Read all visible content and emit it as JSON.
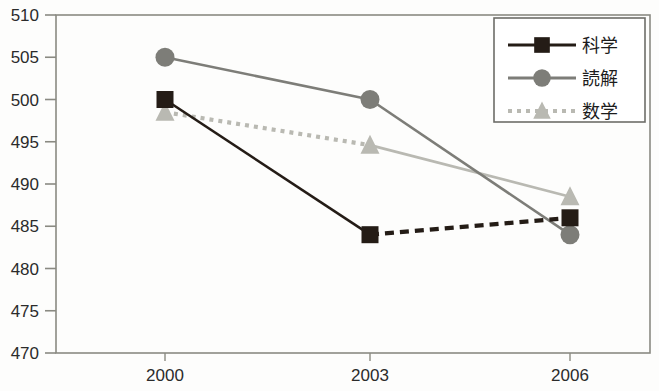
{
  "chart_data": {
    "type": "line",
    "title": "",
    "subtitle": "",
    "xlabel": "",
    "ylabel": "",
    "categories": [
      "2000",
      "2003",
      "2006"
    ],
    "x": [
      2000,
      2003,
      2006
    ],
    "xlim": [
      2000,
      2006
    ],
    "ylim": [
      470,
      510
    ],
    "yticks": [
      470,
      475,
      480,
      485,
      490,
      495,
      500,
      505,
      510
    ],
    "ytick_labels": [
      "470",
      "475",
      "480",
      "485",
      "490",
      "495",
      "500",
      "505",
      "510"
    ],
    "xtick_labels": [
      "2000",
      "2003",
      "2006"
    ],
    "grid": false,
    "legend_position": "top-right",
    "series": [
      {
        "name": "科学",
        "values": [
          500,
          484,
          486
        ],
        "color": "#241c16",
        "marker": "square",
        "segment_styles": [
          "solid",
          "dashed"
        ]
      },
      {
        "name": "読解",
        "values": [
          505,
          500,
          484
        ],
        "color": "#7d7d78",
        "marker": "circle",
        "segment_styles": [
          "solid",
          "solid"
        ]
      },
      {
        "name": "数学",
        "values": [
          498.5,
          494.6,
          488.5
        ],
        "color": "#b9b9b2",
        "marker": "triangle",
        "segment_styles": [
          "dotted",
          "solid"
        ]
      }
    ],
    "annotations": []
  },
  "axes": {
    "frame_color": "#8a8a82",
    "tick_color": "#8a8a82"
  },
  "legend": {
    "items": [
      {
        "label": "科学",
        "marker": "square",
        "color": "#241c16"
      },
      {
        "label": "読解",
        "marker": "circle",
        "color": "#7d7d78"
      },
      {
        "label": "数学",
        "marker": "triangle",
        "color": "#b9b9b2"
      }
    ],
    "border_color": "#6d6d68"
  }
}
